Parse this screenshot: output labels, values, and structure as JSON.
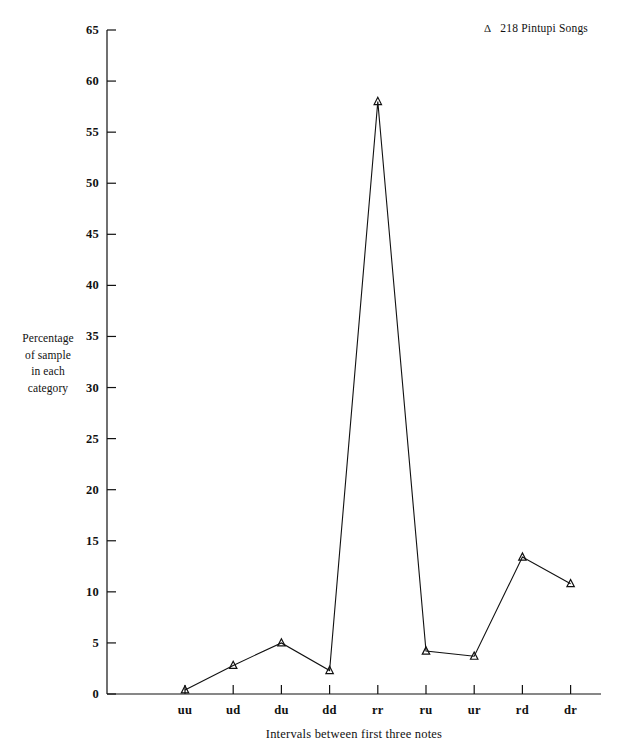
{
  "chart_data": {
    "type": "line",
    "title": "",
    "subtitle": "",
    "xlabel": "Intervals between first three notes",
    "ylabel": "Percentage of sample in each category",
    "ylabel_lines": [
      "Percentage",
      "of sample",
      "in each",
      "category"
    ],
    "categories": [
      "uu",
      "ud",
      "du",
      "dd",
      "rr",
      "ru",
      "ur",
      "rd",
      "dr"
    ],
    "series": [
      {
        "name": "218 Pintupi Songs",
        "marker": "triangle",
        "color": "#111111",
        "values": [
          0.4,
          2.8,
          5.0,
          2.3,
          58.0,
          4.2,
          3.7,
          13.4,
          10.8
        ]
      }
    ],
    "values": [
      0.4,
      2.8,
      5.0,
      2.3,
      58.0,
      4.2,
      3.7,
      13.4,
      10.8
    ],
    "ylim": [
      0,
      65
    ],
    "ytick_step": 5,
    "yticks": [
      0,
      5,
      10,
      15,
      20,
      25,
      30,
      35,
      40,
      45,
      50,
      55,
      60,
      65
    ],
    "ytick_labels": [
      "0",
      "5",
      "10",
      "15",
      "20",
      "25",
      "30",
      "35",
      "40",
      "45",
      "50",
      "55",
      "60",
      "65"
    ],
    "grid": false,
    "legend_position": "top-right",
    "legend": [
      {
        "marker": "Δ",
        "label": "218 Pintupi Songs"
      }
    ]
  },
  "legend": {
    "marker_glyph": "Δ",
    "label": "218 Pintupi Songs"
  },
  "axes": {
    "x_title": "Intervals between first three notes",
    "y_title_lines": [
      "Percentage",
      "of sample",
      "in each",
      "category"
    ]
  }
}
